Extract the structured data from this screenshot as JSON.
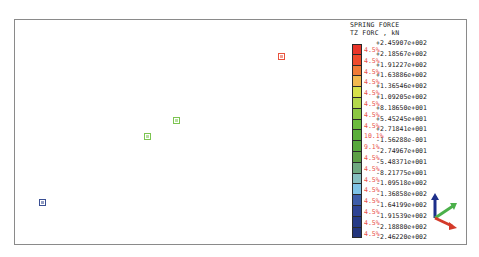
{
  "legend": {
    "title_line1": "SPRING FORCE",
    "title_line2": "TZ FORC , kN",
    "ticks": [
      "+2.45907e+002",
      "+2.18567e+002",
      "+1.91227e+002",
      "+1.63886e+002",
      "+1.36546e+002",
      "+1.09205e+002",
      "+8.18650e+001",
      "+5.45245e+001",
      "+2.71841e+001",
      "-1.56288e-001",
      "-2.74967e+001",
      "-5.48371e+001",
      "-8.21775e+001",
      "-1.09518e+002",
      "-1.36858e+002",
      "-1.64199e+002",
      "-1.91539e+002",
      "-2.18880e+002",
      "-2.46220e+002"
    ],
    "bands": [
      {
        "pct": "4.5%",
        "color": "#e8352a"
      },
      {
        "pct": "4.5%",
        "color": "#ee4a2c"
      },
      {
        "pct": "4.5%",
        "color": "#f07a36"
      },
      {
        "pct": "4.5%",
        "color": "#f2b84e"
      },
      {
        "pct": "4.5%",
        "color": "#d7e24a"
      },
      {
        "pct": "4.5%",
        "color": "#b4d84a"
      },
      {
        "pct": "4.5%",
        "color": "#8cc843"
      },
      {
        "pct": "4.5%",
        "color": "#6cbb3e"
      },
      {
        "pct": "10.1%",
        "color": "#5aae3a"
      },
      {
        "pct": "9.1%",
        "color": "#57a83c"
      },
      {
        "pct": "4.5%",
        "color": "#5c9f45"
      },
      {
        "pct": "4.5%",
        "color": "#6fa880"
      },
      {
        "pct": "4.5%",
        "color": "#86bfc0"
      },
      {
        "pct": "4.5%",
        "color": "#7fc3e6"
      },
      {
        "pct": "4.5%",
        "color": "#3e5da8"
      },
      {
        "pct": "4.5%",
        "color": "#2e4393"
      },
      {
        "pct": "4.5%",
        "color": "#263a86"
      },
      {
        "pct": "4.5%",
        "color": "#23357c"
      }
    ]
  },
  "markers": [
    {
      "x": 263,
      "y": 33,
      "color": "#e8523d"
    },
    {
      "x": 158,
      "y": 97,
      "color": "#7cc450"
    },
    {
      "x": 129,
      "y": 113,
      "color": "#7cc450"
    },
    {
      "x": 24,
      "y": 179,
      "color": "#3a4f93"
    }
  ],
  "triad": {
    "x_color": "#d43a2a",
    "y_color": "#4bb04a",
    "z_color": "#1d2f8a"
  }
}
